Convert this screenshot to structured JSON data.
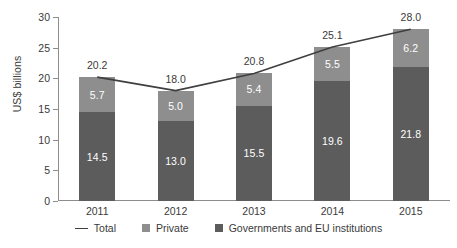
{
  "chart_data": {
    "type": "bar",
    "subtype": "stacked-bar-with-total-line",
    "title": "",
    "xlabel": "",
    "ylabel": "US$ billions",
    "ylim": [
      0,
      30
    ],
    "yticks": [
      0,
      5,
      10,
      15,
      20,
      25,
      30
    ],
    "ytick_labels": [
      "0",
      "5",
      "10",
      "15",
      "20",
      "25",
      "30"
    ],
    "grid": false,
    "legend_position": "bottom",
    "categories": [
      "2011",
      "2012",
      "2013",
      "2014",
      "2015"
    ],
    "series": [
      {
        "name": "Governments and EU institutions",
        "color": "#5c5c5c",
        "values": [
          14.5,
          13.0,
          15.5,
          19.6,
          21.8
        ],
        "labels": [
          "14.5",
          "13.0",
          "15.5",
          "19.6",
          "21.8"
        ]
      },
      {
        "name": "Private",
        "color": "#8e8e8e",
        "values": [
          5.7,
          5.0,
          5.4,
          5.5,
          6.2
        ],
        "labels": [
          "5.7",
          "5.0",
          "5.4",
          "5.5",
          "6.2"
        ]
      }
    ],
    "total_line": {
      "name": "Total",
      "color": "#3f3f3f",
      "values": [
        20.2,
        18.0,
        20.8,
        25.1,
        28.0
      ],
      "labels": [
        "20.2",
        "18.0",
        "20.8",
        "25.1",
        "28.0"
      ]
    }
  },
  "legend": {
    "items": [
      {
        "label": "Total",
        "marker": "line",
        "color": "#3f3f3f"
      },
      {
        "label": "Private",
        "marker": "square",
        "color": "#8e8e8e"
      },
      {
        "label": "Governments and EU institutions",
        "marker": "square",
        "color": "#5c5c5c"
      }
    ]
  }
}
